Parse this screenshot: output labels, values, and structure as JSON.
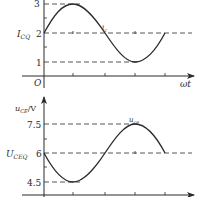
{
  "top_chart": {
    "y_ticks": [
      {
        "label": "3",
        "value": 3
      },
      {
        "label": "2",
        "value": 2
      },
      {
        "label": "1",
        "value": 1
      }
    ],
    "quiescent_label_main": "I",
    "quiescent_label_sub": "CQ",
    "origin_label": "O",
    "x_label": "ωt",
    "curve_label_main": "i",
    "curve_label_sub": "c",
    "color": "#2a2a2a"
  },
  "bottom_chart": {
    "y_axis_label_main": "u",
    "y_axis_label_sub": "CE",
    "y_axis_label_unit": "/V",
    "y_ticks": [
      {
        "label": "7.5",
        "value": 7.5
      },
      {
        "label": "6",
        "value": 6
      },
      {
        "label": "4.5",
        "value": 4.5
      }
    ],
    "quiescent_label_main": "U",
    "quiescent_label_sub": "CEQ",
    "curve_label_main": "u",
    "curve_label_sub": "ce",
    "color": "#2a2a2a"
  }
}
